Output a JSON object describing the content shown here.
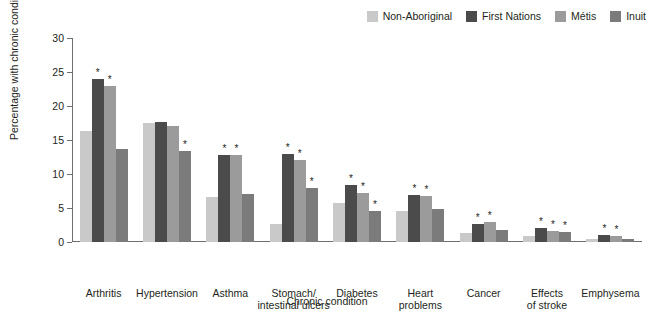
{
  "chart_data": {
    "type": "bar",
    "title": "",
    "xlabel": "Chronic condition",
    "ylabel": "Percentage with chronic condition",
    "ylim": [
      0,
      30
    ],
    "yticks": [
      0,
      5,
      10,
      15,
      20,
      25,
      30
    ],
    "grid": false,
    "legend_position": "top-right",
    "significance_marker": "*",
    "categories": [
      "Arthritis",
      "Hypertension",
      "Asthma",
      "Stomach/\nintestinal ulcers",
      "Diabetes",
      "Heart\nproblems",
      "Cancer",
      "Effects\nof stroke",
      "Emphysema"
    ],
    "category_lines": [
      [
        "Arthritis"
      ],
      [
        "Hypertension"
      ],
      [
        "Asthma"
      ],
      [
        "Stomach/",
        "intestinal ulcers"
      ],
      [
        "Diabetes"
      ],
      [
        "Heart",
        "problems"
      ],
      [
        "Cancer"
      ],
      [
        "Effects",
        "of stroke"
      ],
      [
        "Emphysema"
      ]
    ],
    "series": [
      {
        "name": "Non-Aboriginal",
        "color": "#c9c9c9",
        "values": [
          16.3,
          17.5,
          6.6,
          2.6,
          5.7,
          4.5,
          1.3,
          0.9,
          0.4
        ],
        "significant": [
          false,
          false,
          false,
          false,
          false,
          false,
          false,
          false,
          false
        ]
      },
      {
        "name": "First Nations",
        "color": "#4b4b4b",
        "values": [
          24.0,
          17.7,
          12.8,
          13.0,
          8.4,
          6.9,
          2.6,
          2.0,
          1.0
        ],
        "significant": [
          true,
          false,
          true,
          true,
          true,
          true,
          true,
          true,
          true
        ]
      },
      {
        "name": "Métis",
        "color": "#9b9b9b",
        "values": [
          23.0,
          17.0,
          12.8,
          12.0,
          7.2,
          6.8,
          3.0,
          1.6,
          0.9
        ],
        "significant": [
          true,
          false,
          true,
          true,
          true,
          true,
          true,
          true,
          true
        ]
      },
      {
        "name": "Inuit",
        "color": "#7b7b7b",
        "values": [
          13.7,
          13.4,
          7.1,
          8.0,
          4.6,
          4.9,
          1.7,
          1.5,
          0.5
        ],
        "significant": [
          false,
          true,
          false,
          true,
          true,
          false,
          false,
          true,
          false
        ]
      }
    ]
  },
  "axis": {
    "y_title": "Percentage with chronic condition",
    "x_title": "Chronic condition",
    "y_tick_labels": [
      "0",
      "5",
      "10",
      "15",
      "20",
      "25",
      "30"
    ]
  }
}
